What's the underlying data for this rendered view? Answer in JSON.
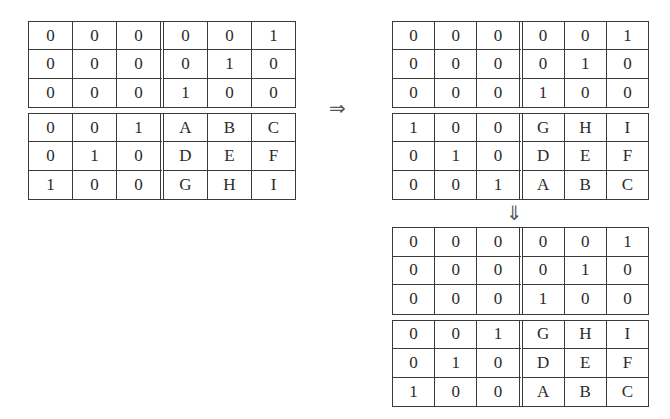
{
  "matrices": [
    {
      "id": "original",
      "top": [
        [
          "0",
          "0",
          "0",
          "0",
          "0",
          "1"
        ],
        [
          "0",
          "0",
          "0",
          "0",
          "1",
          "0"
        ],
        [
          "0",
          "0",
          "0",
          "1",
          "0",
          "0"
        ]
      ],
      "bottom": [
        [
          "0",
          "0",
          "1",
          "A",
          "B",
          "C"
        ],
        [
          "0",
          "1",
          "0",
          "D",
          "E",
          "F"
        ],
        [
          "1",
          "0",
          "0",
          "G",
          "H",
          "I"
        ]
      ]
    },
    {
      "id": "rows-swapped",
      "top": [
        [
          "0",
          "0",
          "0",
          "0",
          "0",
          "1"
        ],
        [
          "0",
          "0",
          "0",
          "0",
          "1",
          "0"
        ],
        [
          "0",
          "0",
          "0",
          "1",
          "0",
          "0"
        ]
      ],
      "bottom": [
        [
          "1",
          "0",
          "0",
          "G",
          "H",
          "I"
        ],
        [
          "0",
          "1",
          "0",
          "D",
          "E",
          "F"
        ],
        [
          "0",
          "0",
          "1",
          "A",
          "B",
          "C"
        ]
      ]
    },
    {
      "id": "result",
      "top": [
        [
          "0",
          "0",
          "0",
          "0",
          "0",
          "1"
        ],
        [
          "0",
          "0",
          "0",
          "0",
          "1",
          "0"
        ],
        [
          "0",
          "0",
          "0",
          "1",
          "0",
          "0"
        ]
      ],
      "bottom": [
        [
          "0",
          "0",
          "1",
          "G",
          "H",
          "I"
        ],
        [
          "0",
          "1",
          "0",
          "D",
          "E",
          "F"
        ],
        [
          "1",
          "0",
          "0",
          "A",
          "B",
          "C"
        ]
      ]
    }
  ],
  "arrows": {
    "right": "⇒",
    "down": "⇓"
  }
}
